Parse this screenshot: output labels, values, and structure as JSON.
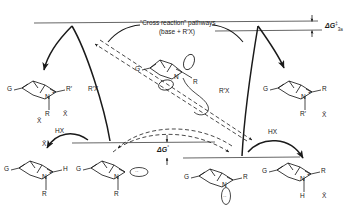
{
  "figure": {
    "type": "reaction-energy-profile-diagram",
    "title_annotation": "“Cross reaction” pathways",
    "title_annotation_line2": "(base + R′X)"
  },
  "energy_labels": {
    "barrier": "ΔG",
    "barrier_dagger": "‡",
    "barrier_subscript": "3a",
    "ground": "ΔG",
    "ground_standard": "°"
  },
  "reagents": {
    "alkylating_left": "R′X",
    "alkylating_right": "R′X",
    "acid_left": "HX",
    "acid_right": "HX",
    "counterion": "X̄"
  },
  "structures": [
    {
      "id": "upper-left-ammonium",
      "position": "upper-left",
      "substituent": "G",
      "nitrogen": "N",
      "charge": "+",
      "equatorial": "R′",
      "axial": "R",
      "counterion": "X̄"
    },
    {
      "id": "upper-right-ammonium",
      "position": "upper-right",
      "substituent": "G",
      "nitrogen": "N",
      "charge": "+",
      "equatorial": "R",
      "axial": "R′",
      "counterion": "X̄"
    },
    {
      "id": "center-amine-invertomer",
      "position": "center",
      "substituent": "G",
      "nitrogen": "N",
      "equatorial": "R",
      "lone_pair": "··"
    },
    {
      "id": "lower-left-ammonium",
      "position": "lower-left",
      "substituent": "G",
      "nitrogen": "N",
      "charge": "+",
      "equatorial": "H",
      "axial": "R",
      "counterion": "X̄"
    },
    {
      "id": "lower-left-amine",
      "position": "lower-center-left",
      "substituent": "G",
      "nitrogen": "N",
      "axial": "R",
      "lone_pair": "··"
    },
    {
      "id": "lower-right-amine",
      "position": "lower-center-right",
      "substituent": "G",
      "nitrogen": "N",
      "equatorial": "R",
      "lone_pair": "··"
    },
    {
      "id": "lower-right-ammonium",
      "position": "lower-right",
      "substituent": "G",
      "nitrogen": "N",
      "charge": "+",
      "equatorial": "R",
      "axial": "H",
      "counterion": "X̄"
    }
  ],
  "colors": {
    "ink": "#1a1a1a",
    "line": "#444444",
    "background": "#ffffff"
  }
}
